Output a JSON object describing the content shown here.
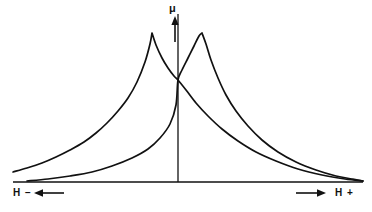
{
  "figure": {
    "background_color": "#ffffff",
    "line_color": "#111111",
    "width": 372,
    "height": 212
  },
  "labels": {
    "y_axis": "μ",
    "x_axis_left": "H −",
    "x_axis_right": "H +"
  },
  "icons": {
    "mu_up_arrow": "arrow-up-icon",
    "h_minus_left_arrow": "arrow-left-icon",
    "h_plus_right_arrow": "arrow-right-icon"
  },
  "chart_data": {
    "type": "line",
    "title": "",
    "xlabel": "H",
    "ylabel": "μ",
    "grid": false,
    "legend": null,
    "axes": {
      "y_axis_x_px": 178,
      "baseline_y_px": 182,
      "x_axis_start_px": 13,
      "x_axis_end_px": 363,
      "y_axis_top_px": 14,
      "y_axis_arrow": true,
      "x_left_arrow": true,
      "x_right_arrow": true
    },
    "annotations": [
      "μ axis points upward",
      "H − direction to the left",
      "H + direction to the right",
      "curves intersect on the μ axis"
    ],
    "series": [
      {
        "name": "descending-branch",
        "description": "Permeability curve peaking left of the μ axis, decaying to the right",
        "peak": {
          "x_px": 152,
          "y_px": 33
        },
        "points_px": [
          [
            13,
            172
          ],
          [
            27,
            168
          ],
          [
            42,
            163
          ],
          [
            56,
            157
          ],
          [
            70,
            150
          ],
          [
            84,
            142
          ],
          [
            96,
            133
          ],
          [
            107,
            123
          ],
          [
            118,
            111
          ],
          [
            128,
            98
          ],
          [
            137,
            82
          ],
          [
            145,
            62
          ],
          [
            150,
            44
          ],
          [
            152,
            33
          ],
          [
            156,
            45
          ],
          [
            162,
            58
          ],
          [
            168,
            68
          ],
          [
            174,
            76
          ],
          [
            178,
            80
          ],
          [
            186,
            90
          ],
          [
            196,
            103
          ],
          [
            208,
            116
          ],
          [
            222,
            129
          ],
          [
            238,
            141
          ],
          [
            256,
            152
          ],
          [
            276,
            161
          ],
          [
            298,
            169
          ],
          [
            322,
            175
          ],
          [
            345,
            179
          ],
          [
            363,
            181
          ]
        ]
      },
      {
        "name": "ascending-branch",
        "description": "Mirror permeability curve peaking right of the μ axis, decaying to the left",
        "peak": {
          "x_px": 202,
          "y_px": 33
        },
        "points_px": [
          [
            27,
            181
          ],
          [
            48,
            179
          ],
          [
            70,
            176
          ],
          [
            92,
            172
          ],
          [
            112,
            166
          ],
          [
            132,
            158
          ],
          [
            148,
            149
          ],
          [
            160,
            138
          ],
          [
            170,
            124
          ],
          [
            176,
            105
          ],
          [
            178,
            80
          ],
          [
            182,
            70
          ],
          [
            188,
            58
          ],
          [
            194,
            46
          ],
          [
            199,
            36
          ],
          [
            202,
            33
          ],
          [
            206,
            44
          ],
          [
            211,
            60
          ],
          [
            218,
            78
          ],
          [
            226,
            95
          ],
          [
            236,
            111
          ],
          [
            248,
            126
          ],
          [
            262,
            140
          ],
          [
            278,
            152
          ],
          [
            296,
            162
          ],
          [
            316,
            170
          ],
          [
            336,
            176
          ],
          [
            352,
            179
          ],
          [
            363,
            181
          ]
        ]
      }
    ]
  }
}
